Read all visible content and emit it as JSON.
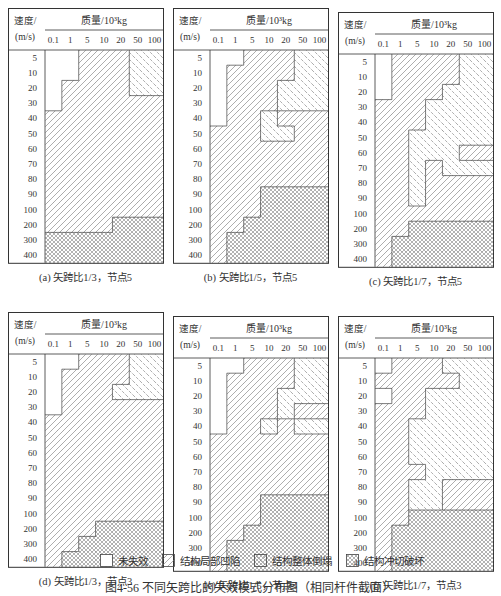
{
  "chart_data": {
    "type": "heatmap",
    "title": "图4-56 不同矢跨比的失效模式分布图（相同杆件截面）",
    "xlabel": "质量/10³kg",
    "ylabel": "速度/(m/s)",
    "x": [
      "0.1",
      "1",
      "5",
      "10",
      "20",
      "50",
      "100"
    ],
    "y": [
      "5",
      "10",
      "20",
      "30",
      "40",
      "50",
      "60",
      "70",
      "80",
      "90",
      "100",
      "200",
      "300",
      "400"
    ],
    "legend": {
      "N": "未失效",
      "L": "结构局部凹陷",
      "C": "结构整体倒塌",
      "P": "结构冲切破坏"
    },
    "panels": [
      {
        "id": "a",
        "caption": "(a) 矢跨比1/3，节点5",
        "grid": [
          "NNLLLCC",
          "NNLLLCC",
          "NLLLLCC",
          "NLLLLLL",
          "LLLLLLL",
          "LLLLLLL",
          "LLLLLLL",
          "LLLLLLL",
          "LLLLLLL",
          "LLLLLLL",
          "LLLLLLL",
          "LLLLPPP",
          "PPPPPPP",
          "PPPPPPP"
        ]
      },
      {
        "id": "b",
        "caption": "(b) 矢跨比1/5，节点5",
        "grid": [
          "NNLLLCC",
          "NLLLLCC",
          "NLLLCCC",
          "NLLLCCC",
          "NLLCLLL",
          "LLLCCLL",
          "LLLLLLL",
          "LLLLLLL",
          "LLLLLLL",
          "LLLPPPP",
          "LLLPPPP",
          "LLPPPPP",
          "LPPPPPP",
          "LPPPPPP"
        ]
      },
      {
        "id": "c",
        "caption": "(c) 矢跨比1/7，节点5",
        "grid": [
          "NLLLLCC",
          "NLLLLCC",
          "NLLLCCC",
          "LLLCCCC",
          "LLLCCCC",
          "LLCCCCC",
          "LLCCCLL",
          "LLCLCCC",
          "LLCLLLL",
          "LLCLLLL",
          "LLLLLLL",
          "LLPPPPP",
          "LPPPPPP",
          "LPPPPPP"
        ]
      },
      {
        "id": "d",
        "caption": "(d) 矢跨比1/3，节点3",
        "grid": [
          "NNLLLCC",
          "NLLLLCC",
          "NLLLCCC",
          "NLLLLLL",
          "LLLLLLL",
          "LLLLLLL",
          "LLLLLLL",
          "LLLLLLL",
          "LLLLLLL",
          "LLLLLLL",
          "LLLLLLL",
          "LLLPPPP",
          "LLPPPPP",
          "LPPPPPP"
        ]
      },
      {
        "id": "e",
        "caption": "(e) 矢跨比1/5，节点3",
        "grid": [
          "NNLLLCC",
          "NLLLLCC",
          "NLLLCCC",
          "NLLLCLL",
          "NLLCLCC",
          "LLLLLLL",
          "LLLLLLL",
          "LLLLLLL",
          "LLLLLLL",
          "LLLPPPP",
          "LLLPPPP",
          "LLPPPPP",
          "LPPPPPP",
          "LPPPPPP"
        ]
      },
      {
        "id": "f",
        "caption": "(f) 矢跨比1/7，节点3",
        "grid": [
          "NLLLCCC",
          "LLLLLCC",
          "NLLCCCC",
          "LLLCCCC",
          "LLCCCCC",
          "LLCCCCC",
          "LLCCCCC",
          "LLLCCCC",
          "LLCCLLL",
          "LLCCLLL",
          "LLPPPPP",
          "LPPPPPP",
          "LPPPPPP",
          "LPPPPPP"
        ]
      }
    ]
  },
  "legend_items": [
    {
      "code": "N",
      "label": "未失效"
    },
    {
      "code": "L",
      "label": "结构局部凹陷"
    },
    {
      "code": "C",
      "label": "结构整体倒塌"
    },
    {
      "code": "P",
      "label": "结构冲切破坏"
    }
  ],
  "axis": {
    "speed_label": "速度/",
    "speed_unit": "(m/s)",
    "mass_label": "质量/10³kg"
  },
  "figure_caption": "图4-56  不同矢跨比的失效模式分布图（相同杆件截面）"
}
